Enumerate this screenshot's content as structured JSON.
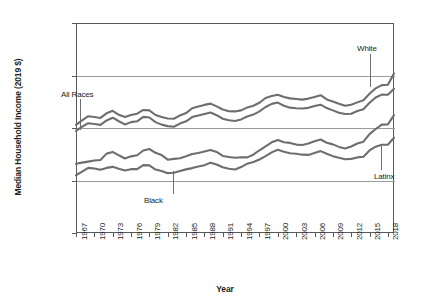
{
  "chart_data": {
    "type": "line",
    "title": "",
    "xlabel": "Year",
    "ylabel": "Median Household Income (2019 $)",
    "xlim": [
      1967,
      2019
    ],
    "ylim": [
      0,
      100000
    ],
    "grid": true,
    "legend_position": "inline-annotations",
    "ytick_labels": [
      "0",
      "25000",
      "50000",
      "75000",
      "100000"
    ],
    "ytick_values": [
      0,
      25000,
      50000,
      75000,
      100000
    ],
    "xtick_labels": [
      "1967",
      "1970",
      "1973",
      "1976",
      "1979",
      "1982",
      "1985",
      "1988",
      "1991",
      "1994",
      "1997",
      "2000",
      "2003",
      "2006",
      "2009",
      "2012",
      "2015",
      "2018"
    ],
    "xtick_values": [
      1967,
      1970,
      1973,
      1976,
      1979,
      1982,
      1985,
      1988,
      1991,
      1994,
      1997,
      2000,
      2003,
      2006,
      2009,
      2012,
      2015,
      2018
    ],
    "x": [
      1967,
      1968,
      1969,
      1970,
      1971,
      1972,
      1973,
      1974,
      1975,
      1976,
      1977,
      1978,
      1979,
      1980,
      1981,
      1982,
      1983,
      1984,
      1985,
      1986,
      1987,
      1988,
      1989,
      1990,
      1991,
      1992,
      1993,
      1994,
      1995,
      1996,
      1997,
      1998,
      1999,
      2000,
      2001,
      2002,
      2003,
      2004,
      2005,
      2006,
      2007,
      2008,
      2009,
      2010,
      2011,
      2012,
      2013,
      2014,
      2015,
      2016,
      2017,
      2018,
      2019
    ],
    "series": [
      {
        "name": "White",
        "annotation": "White",
        "color": "#6d6e71",
        "values": [
          51500,
          53600,
          55600,
          55200,
          54800,
          57000,
          58200,
          56300,
          55200,
          56200,
          56800,
          58600,
          58400,
          56200,
          55200,
          54500,
          54400,
          56000,
          57100,
          59400,
          60200,
          61000,
          61600,
          60300,
          58800,
          58000,
          57900,
          58400,
          59800,
          60600,
          62000,
          64300,
          65200,
          65800,
          64800,
          64100,
          63800,
          63500,
          64000,
          64800,
          65600,
          63600,
          62600,
          61500,
          60600,
          61100,
          62200,
          63200,
          66300,
          68900,
          70400,
          70600,
          76000
        ]
      },
      {
        "name": "All Races",
        "annotation": "All Races",
        "color": "#6d6e71",
        "values": [
          48600,
          50600,
          52300,
          51900,
          51500,
          53600,
          54900,
          53200,
          51700,
          52800,
          53200,
          55300,
          55000,
          52800,
          51600,
          50900,
          50600,
          52100,
          53200,
          55200,
          56000,
          56700,
          57400,
          56100,
          54400,
          53700,
          53300,
          54100,
          55500,
          56400,
          57900,
          60000,
          61500,
          62100,
          60600,
          59700,
          59400,
          59300,
          59600,
          60500,
          61100,
          59500,
          58400,
          57300,
          56700,
          56800,
          58100,
          58900,
          62000,
          64500,
          65900,
          65800,
          68700
        ]
      },
      {
        "name": "Latinx",
        "annotation": "Latinx",
        "color": "#6d6e71",
        "values": [
          33000,
          33500,
          34000,
          34500,
          34800,
          37800,
          38600,
          37000,
          35500,
          36500,
          37000,
          39300,
          40000,
          38200,
          37100,
          34900,
          35300,
          35600,
          36500,
          37600,
          38100,
          38800,
          39500,
          38600,
          36700,
          36200,
          35800,
          36100,
          36000,
          37300,
          39400,
          41300,
          43200,
          44300,
          43200,
          42900,
          42100,
          41900,
          42600,
          43700,
          44500,
          43000,
          42200,
          41000,
          40200,
          41200,
          42600,
          43500,
          47100,
          49500,
          51600,
          51700,
          56100
        ]
      },
      {
        "name": "Black",
        "annotation": "Black",
        "color": "#6d6e71",
        "values": [
          27500,
          29200,
          31000,
          30700,
          30100,
          31000,
          31500,
          30600,
          29800,
          30400,
          30400,
          32300,
          32200,
          30200,
          29500,
          28500,
          28700,
          29500,
          30300,
          30900,
          31700,
          32300,
          33500,
          32600,
          31300,
          30600,
          30200,
          31400,
          33000,
          33800,
          35000,
          36600,
          38400,
          39600,
          38700,
          38000,
          37700,
          37300,
          37200,
          38100,
          39000,
          37700,
          36600,
          35800,
          35100,
          35300,
          36000,
          36300,
          39300,
          41100,
          42000,
          42000,
          45400
        ]
      }
    ]
  },
  "annotations": [
    {
      "id": "all-races",
      "label": "All Races"
    },
    {
      "id": "black",
      "label": "Black"
    },
    {
      "id": "white",
      "label": "White"
    },
    {
      "id": "latinx",
      "label": "Latinx"
    }
  ],
  "axes": {
    "y_title": "Median Household Income (2019 $)",
    "x_title": "Year"
  },
  "colors": {
    "line": "#6d6e71",
    "frame": "#58595b",
    "grid": "#9a9b9e",
    "text": "#231f20"
  }
}
